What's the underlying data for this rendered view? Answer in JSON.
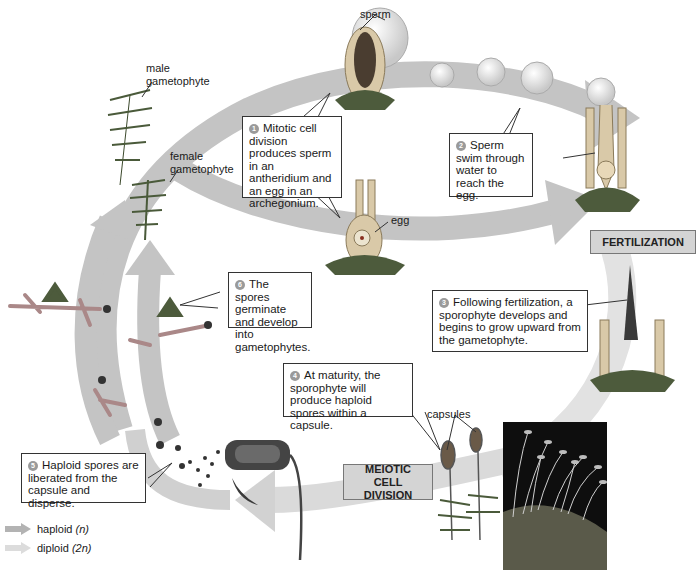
{
  "diagram": {
    "type": "life-cycle",
    "labels": {
      "sperm": "sperm",
      "male_gametophyte": "male gametophyte",
      "female_gametophyte": "female gametophyte",
      "egg": "egg",
      "capsules": "capsules"
    },
    "stages": {
      "fertilization": "FERTILIZATION",
      "meiotic": "MEIOTIC CELL DIVISION"
    },
    "steps": [
      {
        "number": "1",
        "text": "Mitotic cell division produces sperm in an antheridium and an egg in an archegonium."
      },
      {
        "number": "2",
        "text": "Sperm swim through water to reach the egg."
      },
      {
        "number": "3",
        "text": "Following fertilization, a sporophyte develops and begins to grow upward from the gametophyte."
      },
      {
        "number": "4",
        "text": "At maturity, the sporophyte will produce haploid spores within a capsule."
      },
      {
        "number": "5",
        "text": "Haploid spores are liberated from the capsule and disperse."
      },
      {
        "number": "6",
        "text": "The spores germinate and develop into gametophytes."
      }
    ],
    "legend": [
      {
        "label": "haploid",
        "notation": "(n)",
        "color": "#b3b3b3"
      },
      {
        "label": "diploid",
        "notation": "(2n)",
        "color": "#dcdcdc"
      }
    ],
    "colors": {
      "haploid_arrow": "#b3b3b3",
      "diploid_arrow": "#dcdcdc",
      "stage_box": "#d4d4d4"
    }
  }
}
